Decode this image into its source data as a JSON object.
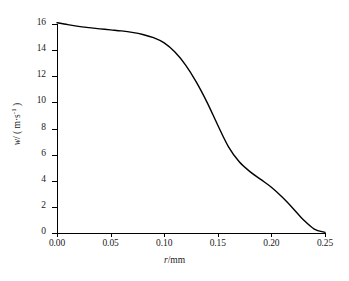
{
  "chart_data": {
    "type": "line",
    "title": "",
    "subtitle": "",
    "xlabel": "r/mm",
    "xlabel_parts": {
      "variable": "r",
      "separator": "/",
      "unit": "mm"
    },
    "ylabel": "w/ ( m·s⁻¹ )",
    "ylabel_parts": {
      "variable": "w",
      "separator": "/",
      "unit": "m·s",
      "exponent": "-1"
    },
    "xlim": [
      0.0,
      0.25
    ],
    "ylim": [
      0,
      16
    ],
    "grid": false,
    "legend": null,
    "legend_position": "none",
    "xticks": [
      0.0,
      0.05,
      0.1,
      0.15,
      0.2,
      0.25
    ],
    "xtick_labels": [
      "0.00",
      "0.05",
      "0.10",
      "0.15",
      "0.20",
      "0.25"
    ],
    "yticks": [
      0,
      2,
      4,
      6,
      8,
      10,
      12,
      14,
      16
    ],
    "ytick_labels": [
      "0",
      "2",
      "4",
      "6",
      "8",
      "10",
      "12",
      "14",
      "16"
    ],
    "series": [
      {
        "name": "axial velocity profile",
        "color": "#000000",
        "line_width": 1.4,
        "x": [
          0.0,
          0.01,
          0.02,
          0.03,
          0.04,
          0.05,
          0.06,
          0.07,
          0.08,
          0.09,
          0.1,
          0.11,
          0.12,
          0.13,
          0.14,
          0.15,
          0.16,
          0.17,
          0.18,
          0.19,
          0.2,
          0.21,
          0.22,
          0.23,
          0.24,
          0.25
        ],
        "y": [
          16.1,
          15.95,
          15.82,
          15.72,
          15.63,
          15.55,
          15.47,
          15.36,
          15.2,
          14.95,
          14.55,
          13.85,
          12.85,
          11.55,
          10.0,
          8.25,
          6.6,
          5.45,
          4.7,
          4.1,
          3.5,
          2.75,
          1.9,
          1.0,
          0.3,
          0.05
        ]
      }
    ]
  }
}
